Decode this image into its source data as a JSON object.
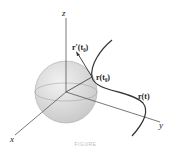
{
  "figure": {
    "axes": {
      "x_label": "x",
      "y_label": "y",
      "z_label": "z"
    },
    "labels": {
      "tangent": "r′(t₀)",
      "point": "r(t₀)",
      "curve": "r(t)"
    },
    "caption": "FIGURE"
  }
}
